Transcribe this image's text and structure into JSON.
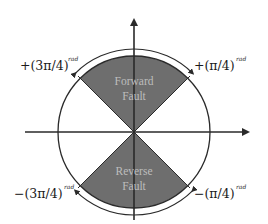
{
  "diagram": {
    "type": "polar-fault-direction",
    "colors": {
      "sector_fill": "#6e6e6e",
      "line": "#2a2a2a",
      "sector_text": "#c4c4c4",
      "background": "#ffffff"
    },
    "regions": [
      {
        "name": "forward",
        "line1": "Forward",
        "line2": "Fault"
      },
      {
        "name": "reverse",
        "line1": "Reverse",
        "line2": "Fault"
      }
    ],
    "angle_labels": {
      "top_left": {
        "sign": "+",
        "value": "(3π/4)",
        "unit": "rad"
      },
      "top_right": {
        "sign": "+",
        "value": "(π/4)",
        "unit": "rad"
      },
      "bottom_left": {
        "sign": "−",
        "value": "(3π/4)",
        "unit": "rad"
      },
      "bottom_right": {
        "sign": "−",
        "value": "(π/4)",
        "unit": "rad"
      }
    }
  }
}
